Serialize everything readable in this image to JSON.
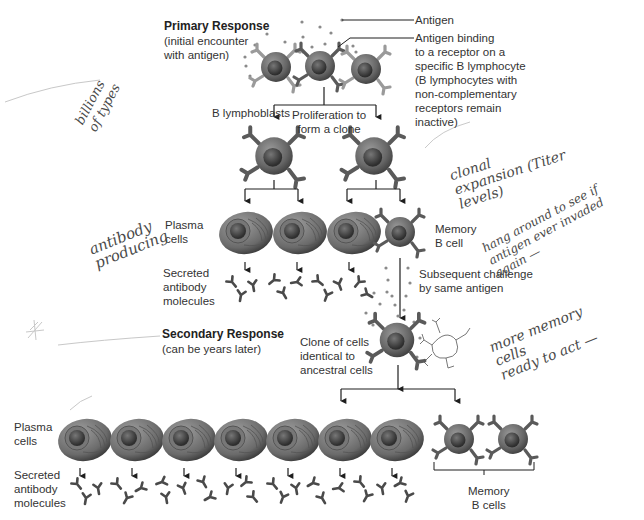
{
  "primary": {
    "heading": "Primary Response",
    "subheading": "(initial encounter\nwith antigen)"
  },
  "labels": {
    "antigen": "Antigen",
    "antigen_binding": "Antigen binding\nto a receptor on a\nspecific B lymphocyte\n(B lymphocytes with\nnon-complementary\nreceptors remain\ninactive)",
    "b_lymphoblasts": "B lymphoblasts",
    "proliferation": "Proliferation to\nform a clone",
    "plasma_cells_1": "Plasma\ncells",
    "memory_b_cell": "Memory\nB cell",
    "secreted_1": "Secreted\nantibody\nmolecules",
    "subsequent_challenge": "Subsequent challenge\nby same antigen",
    "clone_identical": "Clone of cells\nidentical to\nancestral cells",
    "plasma_cells_2": "Plasma\ncells",
    "secreted_2": "Secreted\nantibody\nmolecules",
    "memory_b_cells": "Memory\nB cells"
  },
  "secondary": {
    "heading": "Secondary Response",
    "subheading": "(can be years later)"
  },
  "handwritten_notes": {
    "billions": "billions\nof types",
    "clonal_expansion": "clonal\nexpansion (Titer\nlevels)",
    "antibody_producing": "antibody\nproducing",
    "hang_around": "hang around to see if\nantigen ever invaded\nagain —",
    "more_memory": "more memory\ncells\nready to act —"
  },
  "colors": {
    "cell_body": "#6e6e6e",
    "cell_nucleus": "#3c3c3c",
    "line": "#1e1e1e",
    "receptor": "#5a5a5a",
    "antigen_dot": "#8a8a8a",
    "handwriting": "#4a4a4a"
  },
  "counts": {
    "primary_plasma_cells": 3,
    "primary_memory_cells": 1,
    "secondary_plasma_cells": 7,
    "secondary_memory_cells": 2
  }
}
